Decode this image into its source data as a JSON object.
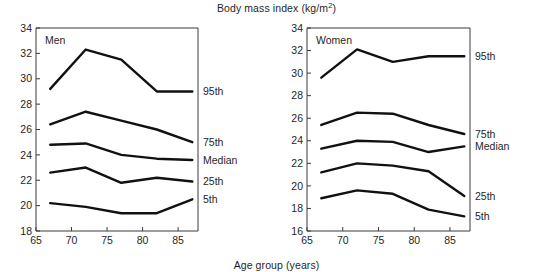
{
  "figure": {
    "title_prefix": "Body mass index (kg/m",
    "title_sup": "2",
    "title_suffix": ")",
    "title_full": "Body mass index (kg/m2)",
    "xaxis_title": "Age group (years)",
    "background": "#ffffff",
    "line_color": "#111111",
    "axis_color": "#3a3a3a"
  },
  "chart_data": [
    {
      "type": "line",
      "title": "Men",
      "panel": "left",
      "xlabel": "Age group (years)",
      "ylabel": "Body mass index (kg/m2)",
      "x": [
        67,
        72,
        77,
        82,
        87
      ],
      "xlim": [
        65,
        87.8
      ],
      "ylim": [
        18,
        34
      ],
      "xticks": [
        65,
        70,
        75,
        80,
        85
      ],
      "yticks": [
        18,
        20,
        22,
        24,
        26,
        28,
        30,
        32,
        34
      ],
      "grid": false,
      "legend_position": "right-inline-end-of-line",
      "series": [
        {
          "name": "95th",
          "label": "95th",
          "values": [
            29.2,
            32.3,
            31.5,
            29.0,
            29.0
          ]
        },
        {
          "name": "75th",
          "label": "75th",
          "values": [
            26.4,
            27.4,
            26.7,
            26.0,
            25.0
          ]
        },
        {
          "name": "Median",
          "label": "Median",
          "values": [
            24.8,
            24.9,
            24.0,
            23.7,
            23.6
          ]
        },
        {
          "name": "25th",
          "label": "25th",
          "values": [
            22.6,
            23.0,
            21.8,
            22.2,
            21.9
          ]
        },
        {
          "name": "5th",
          "label": "5th",
          "values": [
            20.2,
            19.9,
            19.4,
            19.4,
            20.5
          ]
        }
      ]
    },
    {
      "type": "line",
      "title": "Women",
      "panel": "right",
      "xlabel": "Age group (years)",
      "ylabel": "Body mass index (kg/m2)",
      "x": [
        67,
        72,
        77,
        82,
        87
      ],
      "xlim": [
        65,
        87.8
      ],
      "ylim": [
        16,
        34
      ],
      "xticks": [
        65,
        70,
        75,
        80,
        85
      ],
      "yticks": [
        16,
        18,
        20,
        22,
        24,
        26,
        28,
        30,
        32,
        34
      ],
      "grid": false,
      "legend_position": "right-inline-end-of-line",
      "series": [
        {
          "name": "95th",
          "label": "95th",
          "values": [
            29.6,
            32.1,
            31.0,
            31.5,
            31.5
          ]
        },
        {
          "name": "75th",
          "label": "75th",
          "values": [
            25.4,
            26.5,
            26.4,
            25.4,
            24.6
          ]
        },
        {
          "name": "Median",
          "label": "Median",
          "values": [
            23.3,
            24.0,
            23.9,
            23.0,
            23.5
          ]
        },
        {
          "name": "25th",
          "label": "25th",
          "values": [
            21.2,
            22.0,
            21.8,
            21.3,
            19.1
          ]
        },
        {
          "name": "5th",
          "label": "5th",
          "values": [
            18.9,
            19.6,
            19.3,
            17.9,
            17.3
          ]
        }
      ]
    }
  ]
}
